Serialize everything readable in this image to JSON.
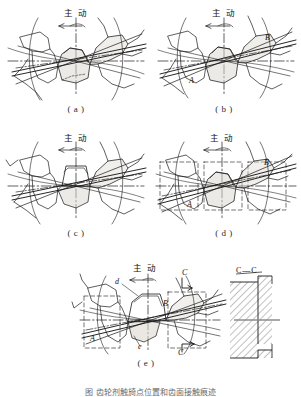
{
  "figure": {
    "kind": "engineering-diagram",
    "background_color": "#ffffff",
    "line_color": "#1a1a1a",
    "shade_color": "#d9d6cf",
    "panels": [
      {
        "id": "a",
        "caption": "( a )",
        "drive_label": "主 动",
        "rotation_arrow": "left-arrow",
        "point_labels": []
      },
      {
        "id": "b",
        "caption": "( b )",
        "drive_label": "主 动",
        "rotation_arrow": "left-arrow",
        "point_labels": [
          "A",
          "B"
        ]
      },
      {
        "id": "c",
        "caption": "( c )",
        "drive_label": "主 动",
        "rotation_arrow": "left-arrow",
        "point_labels": []
      },
      {
        "id": "d",
        "caption": "( d )",
        "drive_label": "主 动",
        "rotation_arrow": "left-arrow",
        "point_labels": [
          "A",
          "B"
        ]
      },
      {
        "id": "e",
        "caption": "( e )",
        "drive_label": "主 动",
        "rotation_arrow": "left-arrow",
        "point_labels": [
          "A",
          "B",
          "d",
          "e"
        ],
        "section_marks": [
          "C",
          "C"
        ],
        "section_view_title": "C—C"
      }
    ],
    "bottom_caption": "图          齿轮剂触旑点位置和齿面接触痕迹"
  }
}
